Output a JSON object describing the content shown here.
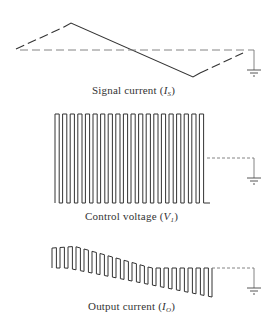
{
  "panels": [
    {
      "id": "signal",
      "label_text": "Signal current (",
      "label_symbol": "I",
      "label_subscript": "S",
      "label_close": ")",
      "waveform": "triangle"
    },
    {
      "id": "control",
      "label_text": "Control voltage (",
      "label_symbol": "V",
      "label_subscript": "1",
      "label_close": ")",
      "waveform": "square",
      "pulse_count": 20
    },
    {
      "id": "output",
      "label_text": "Output current (",
      "label_symbol": "I",
      "label_subscript": "O",
      "label_close": ")",
      "waveform": "modulated-square",
      "pulse_count": 20
    }
  ],
  "colors": {
    "line": "#333333",
    "dashed": "#666666",
    "background": "#ffffff"
  }
}
